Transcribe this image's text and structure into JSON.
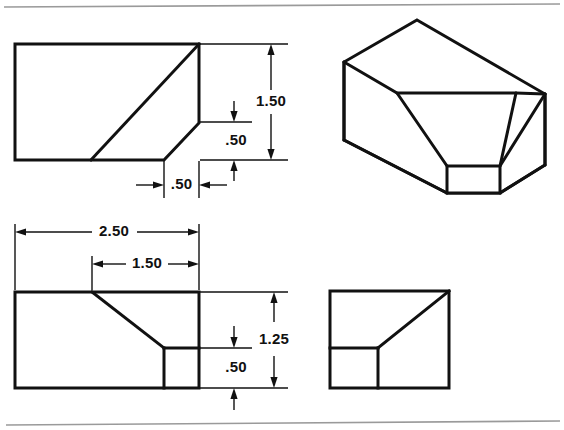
{
  "page": {
    "width": 564,
    "height": 430,
    "background_color": "#ffffff",
    "line_color": "#111111",
    "rule_color": "#9a9a9a"
  },
  "rules": {
    "top_label": "top-horizontal-rule",
    "bottom_label": "bottom-horizontal-rule"
  },
  "views": {
    "front": {
      "name": "front-view",
      "label": "Front View",
      "dimensions": {
        "height_overall": "1.50",
        "height_step": ".50",
        "width_step": ".50"
      }
    },
    "pictorial": {
      "name": "isometric-pictorial-view",
      "label": "Isometric Pictorial"
    },
    "top": {
      "name": "top-view",
      "label": "Top View",
      "dimensions": {
        "width_overall": "2.50",
        "width_notch": "1.50",
        "depth_overall": "1.25",
        "depth_step": ".50"
      }
    },
    "side": {
      "name": "side-view",
      "label": "Side View"
    }
  },
  "dimension_values": {
    "d_1_50_vertical": "1.50",
    "d_0_50_vertical": ".50",
    "d_0_50_horizontal": ".50",
    "d_2_50": "2.50",
    "d_1_50_horizontal": "1.50",
    "d_1_25": "1.25",
    "d_0_50_depth": ".50"
  }
}
